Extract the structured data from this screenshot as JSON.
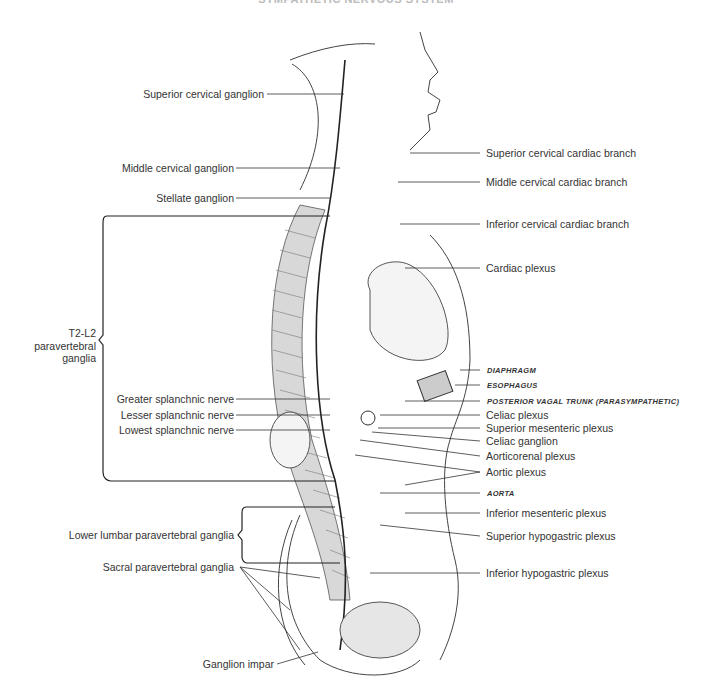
{
  "figure": {
    "title": "SYMPATHETIC NERVOUS SYSTEM",
    "left_labels": [
      {
        "id": "superior_cervical_ganglion",
        "text": "Superior cervical ganglion"
      },
      {
        "id": "middle_cervical_ganglion",
        "text": "Middle cervical ganglion"
      },
      {
        "id": "stellate_ganglion",
        "text": "Stellate ganglion"
      },
      {
        "id": "greater_splanchnic_nerve",
        "text": "Greater splanchnic nerve"
      },
      {
        "id": "lesser_splanchnic_nerve",
        "text": "Lesser splanchnic nerve"
      },
      {
        "id": "lowest_splanchnic_nerve",
        "text": "Lowest splanchnic nerve"
      },
      {
        "id": "sacral_paravertebral_ganglia",
        "text": "Sacral paravertebral ganglia"
      },
      {
        "id": "ganglion_impar",
        "text": "Ganglion impar"
      }
    ],
    "brackets": [
      {
        "id": "t2_l2",
        "lines": [
          "T2-L2",
          "paravertebral",
          "ganglia"
        ]
      },
      {
        "id": "lower_lumbar",
        "text": "Lower lumbar paravertebral ganglia"
      }
    ],
    "right_labels": [
      {
        "id": "superior_cervical_cardiac_branch",
        "text": "Superior cervical cardiac branch"
      },
      {
        "id": "middle_cervical_cardiac_branch",
        "text": "Middle cervical cardiac branch"
      },
      {
        "id": "inferior_cervical_cardiac_branch",
        "text": "Inferior cervical cardiac branch"
      },
      {
        "id": "cardiac_plexus",
        "text": "Cardiac plexus"
      },
      {
        "id": "diaphragm",
        "text": "DIAPHRAGM",
        "style": "caps"
      },
      {
        "id": "esophagus",
        "text": "ESOPHAGUS",
        "style": "caps"
      },
      {
        "id": "posterior_vagal_trunk",
        "text": "POSTERIOR VAGAL TRUNK (PARASYMPATHETIC)",
        "style": "caps"
      },
      {
        "id": "celiac_plexus",
        "text": "Celiac plexus"
      },
      {
        "id": "superior_mesenteric_plexus",
        "text": "Superior mesenteric plexus"
      },
      {
        "id": "celiac_ganglion",
        "text": "Celiac ganglion"
      },
      {
        "id": "aorticorenal_plexus",
        "text": "Aorticorenal plexus"
      },
      {
        "id": "aortic_plexus",
        "text": "Aortic plexus"
      },
      {
        "id": "aorta",
        "text": "AORTA",
        "style": "caps"
      },
      {
        "id": "inferior_mesenteric_plexus",
        "text": "Inferior mesenteric plexus"
      },
      {
        "id": "superior_hypogastric_plexus",
        "text": "Superior hypogastric plexus"
      },
      {
        "id": "inferior_hypogastric_plexus",
        "text": "Inferior hypogastric plexus"
      }
    ]
  }
}
